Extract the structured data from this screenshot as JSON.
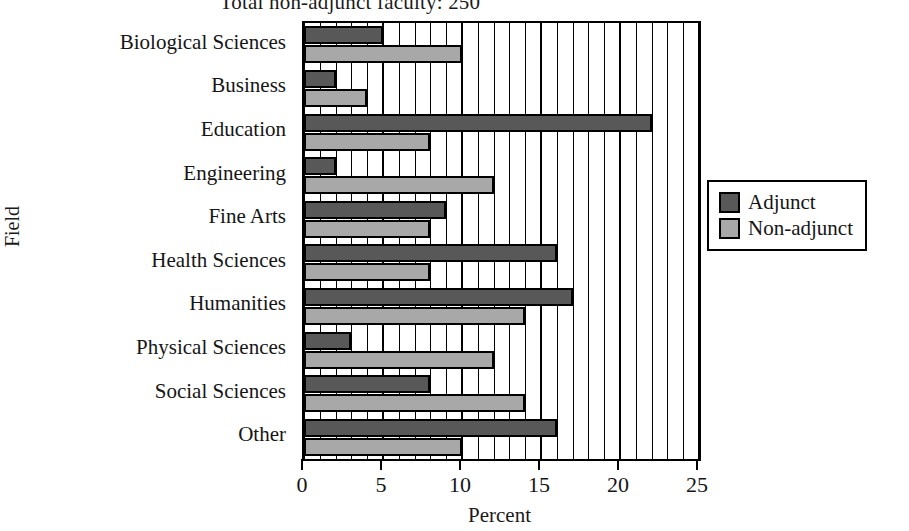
{
  "chart_data": {
    "type": "bar",
    "orientation": "horizontal",
    "title": "Total non-adjunct faculty:  250",
    "xlabel": "Percent",
    "ylabel": "Field",
    "xlim": [
      0,
      25
    ],
    "xticks": [
      0,
      5,
      10,
      15,
      20,
      25
    ],
    "xtick_labels": [
      "0",
      "5",
      "10",
      "15",
      "20",
      "25"
    ],
    "grid": true,
    "grid_minor_step": 1,
    "grid_major_step": 5,
    "legend_position": "right",
    "categories": [
      "Biological Sciences",
      "Business",
      "Education",
      "Engineering",
      "Fine Arts",
      "Health Sciences",
      "Humanities",
      "Physical Sciences",
      "Social Sciences",
      "Other"
    ],
    "series": [
      {
        "name": "Adjunct",
        "color": "#585858",
        "values": [
          5,
          2,
          22,
          2,
          9,
          16,
          17,
          3,
          8,
          16
        ]
      },
      {
        "name": "Non-adjunct",
        "color": "#a8a8a8",
        "values": [
          10,
          4,
          8,
          12,
          8,
          8,
          14,
          12,
          14,
          10
        ]
      }
    ]
  },
  "legend": {
    "entries": [
      {
        "label": "Adjunct",
        "swatch": "adjunct"
      },
      {
        "label": "Non-adjunct",
        "swatch": "nonadjunct"
      }
    ]
  }
}
